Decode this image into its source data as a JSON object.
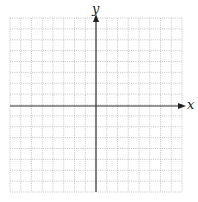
{
  "diagram": {
    "type": "coordinate-grid",
    "x_axis_label": "x",
    "y_axis_label": "y",
    "grid": {
      "columns": 16,
      "rows": 16,
      "left": 10,
      "top": 18,
      "right": 182,
      "bottom": 192
    },
    "origin_px": {
      "x": 96,
      "y": 106
    },
    "colors": {
      "grid": "#aaaaaa",
      "axis": "#333333",
      "background": "#ffffff"
    }
  }
}
